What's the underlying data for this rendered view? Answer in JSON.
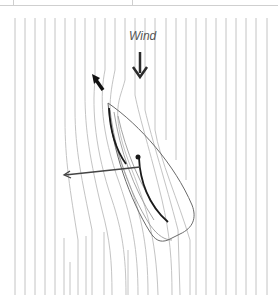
{
  "diagram": {
    "wind_label": "Wind",
    "colors": {
      "streamline": "#c4c4c4",
      "streamline_near": "#9a9a9a",
      "hull": "#6a6a6a",
      "sail": "#1a1a1a",
      "arrow": "#2b2b2b",
      "force_arrow": "#444444",
      "top_rule": "#cfcfcf"
    },
    "elements": [
      {
        "id": "wind-arrow",
        "description": "Bold downward arrow indicating wind direction"
      },
      {
        "id": "flow-arrow",
        "description": "Bold arrow pointing up-left showing deflected airflow"
      },
      {
        "id": "boat-hull",
        "description": "Outline of sailboat hull viewed from above, bow at top-left"
      },
      {
        "id": "jib-sail",
        "description": "Curved foresail near bow"
      },
      {
        "id": "main-sail",
        "description": "Curved mainsail starting at mast dot"
      },
      {
        "id": "force-arrow",
        "description": "Thin arrow from mast pointing left showing resultant force"
      },
      {
        "id": "streamlines",
        "description": "Vertical airflow lines that bend around the boat"
      }
    ]
  }
}
